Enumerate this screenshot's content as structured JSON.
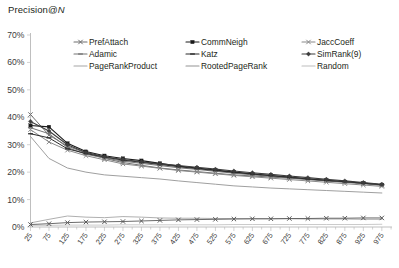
{
  "chart_data": {
    "type": "line",
    "title": "Precision@N",
    "title_plain": "Precision@",
    "title_italic": "N",
    "xlabel": "",
    "ylabel": "",
    "ylim": [
      0,
      0.7
    ],
    "ytick_labels": [
      "0%",
      "10%",
      "20%",
      "30%",
      "40%",
      "50%",
      "60%",
      "70%"
    ],
    "ytick_values": [
      0,
      10,
      20,
      30,
      40,
      50,
      60,
      70
    ],
    "grid": false,
    "legend_position": "top-inside",
    "x_tick_step": 25,
    "x_label_step": 50,
    "xlim": [
      25,
      1000
    ],
    "x": [
      25,
      75,
      125,
      175,
      225,
      275,
      325,
      375,
      425,
      475,
      525,
      575,
      625,
      675,
      725,
      775,
      825,
      875,
      925,
      975
    ],
    "xtick_labels": [
      "25",
      "75",
      "125",
      "175",
      "225",
      "275",
      "325",
      "375",
      "425",
      "475",
      "525",
      "575",
      "625",
      "675",
      "725",
      "775",
      "825",
      "875",
      "925",
      "975"
    ],
    "series": [
      {
        "name": "PrefAttach",
        "color": "#6f6f6f",
        "marker": "cross",
        "width": 1.0,
        "values": [
          41.0,
          33.5,
          29.5,
          27.0,
          25.0,
          23.5,
          22.5,
          21.5,
          20.8,
          20.2,
          19.6,
          19.0,
          18.6,
          18.2,
          17.8,
          17.3,
          16.8,
          16.3,
          15.8,
          15.2
        ]
      },
      {
        "name": "CommNeigh",
        "color": "#1a1a1a",
        "marker": "square",
        "width": 1.1,
        "values": [
          37.0,
          36.5,
          30.5,
          27.5,
          26.0,
          25.0,
          24.2,
          23.2,
          22.2,
          21.5,
          20.8,
          20.0,
          19.4,
          18.8,
          18.2,
          17.6,
          17.0,
          16.5,
          16.0,
          15.4
        ]
      },
      {
        "name": "JaccCoeff",
        "color": "#8a8a8a",
        "marker": "cross",
        "width": 1.0,
        "values": [
          35.5,
          31.0,
          28.0,
          26.0,
          24.5,
          23.0,
          22.2,
          21.4,
          20.6,
          20.0,
          19.4,
          18.8,
          18.3,
          17.8,
          17.3,
          16.8,
          16.3,
          15.8,
          15.3,
          14.8
        ]
      },
      {
        "name": "Adamic",
        "color": "#757575",
        "marker": "dash",
        "width": 1.0,
        "values": [
          36.2,
          34.0,
          29.0,
          26.5,
          25.2,
          24.0,
          23.2,
          22.4,
          21.6,
          21.0,
          20.3,
          19.6,
          19.0,
          18.5,
          18.0,
          17.4,
          16.9,
          16.4,
          15.9,
          15.3
        ]
      },
      {
        "name": "Katz",
        "color": "#2b2b2b",
        "marker": "dash",
        "width": 1.0,
        "values": [
          34.0,
          32.5,
          28.5,
          26.8,
          25.5,
          24.4,
          23.6,
          22.8,
          22.0,
          21.3,
          20.6,
          19.9,
          19.3,
          18.7,
          18.1,
          17.5,
          17.0,
          16.5,
          16.0,
          15.4
        ]
      },
      {
        "name": "SimRank(9)",
        "color": "#3d3d3d",
        "marker": "diamond",
        "width": 1.1,
        "values": [
          38.5,
          35.0,
          30.0,
          27.2,
          25.6,
          24.6,
          23.8,
          23.0,
          22.4,
          21.8,
          21.1,
          20.4,
          19.8,
          19.2,
          18.6,
          18.0,
          17.4,
          16.8,
          16.2,
          15.6
        ]
      },
      {
        "name": "PageRankProduct",
        "color": "#a6a6a6",
        "marker": "none",
        "width": 0.9,
        "values": [
          1.5,
          2.8,
          4.0,
          3.6,
          3.4,
          3.8,
          3.6,
          3.3,
          3.2,
          3.2,
          3.1,
          3.1,
          3.0,
          3.0,
          3.0,
          2.9,
          2.9,
          2.9,
          2.8,
          2.8
        ]
      },
      {
        "name": "RootedPageRank",
        "color": "#949494",
        "marker": "none",
        "width": 0.9,
        "values": [
          33.0,
          25.0,
          21.5,
          20.0,
          19.0,
          18.5,
          18.0,
          17.5,
          16.8,
          16.2,
          15.6,
          15.0,
          14.6,
          14.2,
          13.9,
          13.6,
          13.3,
          13.0,
          12.7,
          12.4
        ]
      },
      {
        "name": "Random",
        "color": "#bdbdbd",
        "marker": "none",
        "width": 0.8,
        "values": [
          0.6,
          0.6,
          0.7,
          0.7,
          0.7,
          0.8,
          0.8,
          0.8,
          0.8,
          0.8,
          0.8,
          0.9,
          0.9,
          0.9,
          0.9,
          0.9,
          0.9,
          0.9,
          0.9,
          1.0
        ]
      }
    ],
    "low_band_series": [
      {
        "name": "low-marker-band",
        "color": "#5a5a5a",
        "marker": "cross",
        "width": 0.9,
        "values": [
          0.9,
          1.2,
          1.6,
          1.8,
          1.9,
          2.0,
          2.2,
          2.4,
          2.6,
          2.7,
          2.8,
          2.9,
          3.0,
          3.0,
          3.1,
          3.1,
          3.2,
          3.2,
          3.3,
          3.3
        ]
      }
    ],
    "legend": [
      {
        "label": "PrefAttach",
        "color": "#6f6f6f",
        "marker": "cross",
        "col": 0,
        "row": 0
      },
      {
        "label": "CommNeigh",
        "color": "#1a1a1a",
        "marker": "square",
        "col": 1,
        "row": 0
      },
      {
        "label": "JaccCoeff",
        "color": "#8a8a8a",
        "marker": "cross",
        "col": 2,
        "row": 0
      },
      {
        "label": "Adamic",
        "color": "#757575",
        "marker": "dash",
        "col": 0,
        "row": 1
      },
      {
        "label": "Katz",
        "color": "#2b2b2b",
        "marker": "dash",
        "col": 1,
        "row": 1
      },
      {
        "label": "SimRank(9)",
        "color": "#3d3d3d",
        "marker": "diamond",
        "col": 2,
        "row": 1
      },
      {
        "label": "PageRankProduct",
        "color": "#a6a6a6",
        "marker": "none",
        "col": 0,
        "row": 2
      },
      {
        "label": "RootedPageRank",
        "color": "#949494",
        "marker": "none",
        "col": 1,
        "row": 2
      },
      {
        "label": "Random",
        "color": "#bdbdbd",
        "marker": "none",
        "col": 2,
        "row": 2
      }
    ]
  }
}
